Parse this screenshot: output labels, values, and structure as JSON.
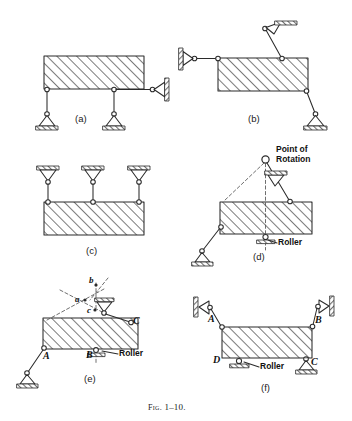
{
  "figure": {
    "caption": "Fig. 1–10.",
    "caption_prefix": "Fig.",
    "caption_number": "1–10."
  },
  "colors": {
    "ink": "#2b2b2b",
    "hatch": "#555555",
    "ground_fill": "#8c8c8c",
    "paper": "#ffffff",
    "dashed": "#555555"
  },
  "panels": [
    {
      "id": "a",
      "label": "(a)",
      "description": "Rigid body on two vertical links with horizontal link to wall",
      "annotations": [],
      "node_labels": []
    },
    {
      "id": "b",
      "label": "(b)",
      "description": "Rigid body with horizontal link to wall, inclined link to upper wall and inclined link to pinned base",
      "annotations": [],
      "node_labels": []
    },
    {
      "id": "c",
      "label": "(c)",
      "description": "Rigid body suspended from three vertical hangers attached to ceiling",
      "annotations": [],
      "node_labels": []
    },
    {
      "id": "d",
      "label": "(d)",
      "description": "Rigid body with inclined links and roller, showing instantaneous point of rotation",
      "annotations": [
        {
          "name": "point-of-rotation",
          "line1": "Point of",
          "line2": "Rotation"
        },
        {
          "name": "roller",
          "line1": "Roller",
          "line2": ""
        }
      ],
      "node_labels": []
    },
    {
      "id": "e",
      "label": "(e)",
      "description": "Rigid body with pin at A, roller at B, inclined link at C and construction lines a, b, c",
      "annotations": [
        {
          "name": "roller",
          "line1": "Roller",
          "line2": ""
        }
      ],
      "node_labels": [
        "A",
        "B",
        "C",
        "a",
        "b",
        "c"
      ]
    },
    {
      "id": "f",
      "label": "(f)",
      "description": "Rigid body with link at A to wall, link at B to wall, pin support at C and roller at D",
      "annotations": [
        {
          "name": "roller",
          "line1": "Roller",
          "line2": ""
        }
      ],
      "node_labels": [
        "A",
        "B",
        "C",
        "D"
      ]
    }
  ],
  "labels": {
    "point_of_rotation_line1": "Point of",
    "point_of_rotation_line2": "Rotation",
    "roller_d": "Roller",
    "roller_e": "Roller",
    "roller_f": "Roller",
    "panel_a": "(a)",
    "panel_b": "(b)",
    "panel_c": "(c)",
    "panel_d": "(d)",
    "panel_e": "(e)",
    "panel_f": "(f)",
    "node_A_e": "A",
    "node_B_e": "B",
    "node_C_e": "C",
    "node_a_e": "a",
    "node_b_e": "b",
    "node_c_e": "c",
    "node_A_f": "A",
    "node_B_f": "B",
    "node_C_f": "C",
    "node_D_f": "D"
  }
}
